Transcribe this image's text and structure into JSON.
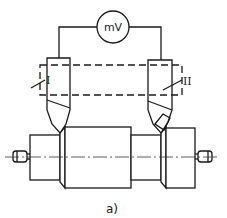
{
  "diagram": {
    "meter_label": "mV",
    "tool_left_label": "I",
    "tool_right_label": "II",
    "caption": "a)"
  }
}
